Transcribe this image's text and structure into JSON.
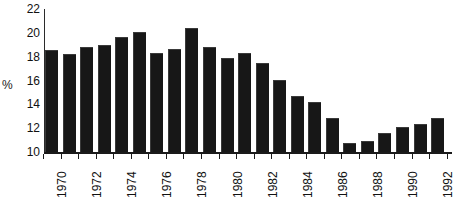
{
  "chart_data": {
    "type": "bar",
    "title": "",
    "subtitle": "",
    "xlabel": "",
    "ylabel": "%",
    "ylim": [
      10,
      22
    ],
    "ytick_labels": [
      "10",
      "12",
      "14",
      "16",
      "18",
      "20",
      "22"
    ],
    "ytick_values": [
      10,
      12,
      14,
      16,
      18,
      20,
      22
    ],
    "grid": false,
    "legend": null,
    "categories": [
      "1970",
      "1971",
      "1972",
      "1973",
      "1974",
      "1975",
      "1976",
      "1977",
      "1978",
      "1979",
      "1980",
      "1981",
      "1982",
      "1983",
      "1984",
      "1985",
      "1986",
      "1987",
      "1988",
      "1989",
      "1990",
      "1991",
      "1992"
    ],
    "xtick_labels_shown": [
      "1970",
      "1972",
      "1974",
      "1976",
      "1978",
      "1980",
      "1982",
      "1984",
      "1986",
      "1988",
      "1990",
      "1992"
    ],
    "values": [
      18.5,
      18.1,
      18.7,
      18.9,
      19.6,
      20.0,
      18.2,
      18.6,
      20.3,
      18.7,
      17.8,
      18.2,
      17.4,
      16.0,
      14.6,
      14.1,
      12.8,
      10.7,
      10.8,
      11.5,
      12.0,
      12.3,
      12.8
    ],
    "bar_color": "#171717",
    "axis_color": "#1a1a1a",
    "background_color": "#ffffff"
  }
}
